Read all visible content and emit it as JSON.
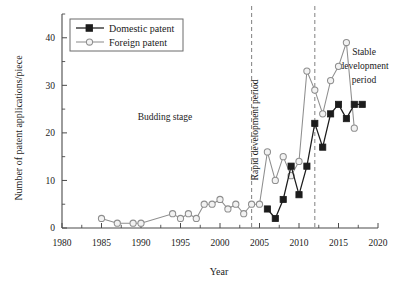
{
  "chart_data": {
    "type": "line",
    "title": "",
    "xlabel": "Year",
    "ylabel": "Number of patent applications/piece",
    "xlim": [
      1980,
      2020
    ],
    "ylim": [
      0,
      45
    ],
    "xticks": [
      1980,
      1985,
      1990,
      1995,
      2000,
      2005,
      2010,
      2015,
      2020
    ],
    "yticks": [
      0,
      10,
      20,
      30,
      40
    ],
    "xtick_labels": [
      "1980",
      "1985",
      "1990",
      "1995",
      "2000",
      "2005",
      "2010",
      "2015",
      "2020"
    ],
    "ytick_labels": [
      "0",
      "10",
      "20",
      "30",
      "40"
    ],
    "grid": false,
    "legend_position": "top-left",
    "series": [
      {
        "name": "Domestic patent",
        "marker": "filled-square",
        "color": "#1c1c1c",
        "x": [
          2006,
          2007,
          2008,
          2009,
          2010,
          2011,
          2012,
          2013,
          2014,
          2015,
          2016,
          2017,
          2018
        ],
        "values": [
          4,
          2,
          6,
          13,
          7,
          13,
          22,
          17,
          24,
          26,
          23,
          26,
          26
        ]
      },
      {
        "name": "Foreign patent",
        "marker": "open-circle",
        "color": "#8e8e8e",
        "x": [
          1985,
          1987,
          1989,
          1990,
          1994,
          1995,
          1996,
          1997,
          1998,
          1999,
          2000,
          2001,
          2002,
          2003,
          2004,
          2005,
          2006,
          2007,
          2008,
          2009,
          2010,
          2011,
          2012,
          2013,
          2014,
          2015,
          2016,
          2017
        ],
        "values": [
          2,
          1,
          1,
          1,
          3,
          2,
          3,
          2,
          5,
          5,
          6,
          4,
          5,
          3,
          5,
          5,
          16,
          10,
          15,
          11,
          14,
          33,
          29,
          24,
          31,
          34,
          39,
          21
        ]
      }
    ],
    "annotations": [
      {
        "text": "Budding stage",
        "x": 1996.5,
        "y": 24,
        "orientation": "horizontal"
      },
      {
        "text": "Rapid development period",
        "x": 2008.2,
        "y": 26,
        "orientation": "vertical"
      },
      {
        "text": "Stable development period",
        "x": 2017.5,
        "y": 35,
        "orientation": "horizontal"
      }
    ],
    "vertical_dividers": [
      {
        "x": 2004
      },
      {
        "x": 2012
      }
    ]
  },
  "legend": {
    "items": [
      {
        "label": "Domestic patent"
      },
      {
        "label": "Foreign patent"
      }
    ]
  },
  "annotations": {
    "budding": "Budding stage",
    "rapid": "Rapid development period",
    "stable_line1": "Stable",
    "stable_line2": "development",
    "stable_line3": "period"
  },
  "axes": {
    "xlabel": "Year",
    "ylabel": "Number of patent applications/piece"
  }
}
